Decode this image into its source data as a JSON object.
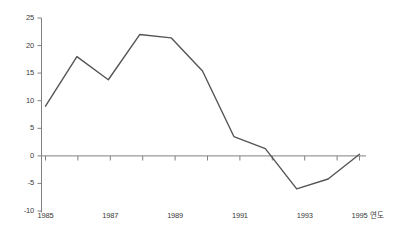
{
  "chart_data": {
    "type": "line",
    "title": "",
    "subtitle": "",
    "xlabel": "연도",
    "ylabel": "",
    "x": [
      1985,
      1986,
      1987,
      1988,
      1989,
      1990,
      1991,
      1992,
      1993,
      1994,
      1995
    ],
    "categories": [
      "1985",
      "1986",
      "1987",
      "1988",
      "1989",
      "1990",
      "1991",
      "1992",
      "1993",
      "1994",
      "1995"
    ],
    "values": [
      9.0,
      18.0,
      13.8,
      22.0,
      21.4,
      15.4,
      3.5,
      1.3,
      -6.0,
      -4.2,
      0.3
    ],
    "series": [
      {
        "name": "",
        "values": [
          9.0,
          18.0,
          13.8,
          22.0,
          21.4,
          15.4,
          3.5,
          1.3,
          -6.0,
          -4.2,
          0.3
        ]
      }
    ],
    "ylim": [
      -10,
      25
    ],
    "xlim": [
      1985,
      1995
    ],
    "yticks": [
      25,
      20,
      15,
      10,
      5,
      0,
      -5,
      -10
    ],
    "ytick_labels": [
      "25",
      "20",
      "15",
      "10",
      "5",
      "0",
      "-5",
      "-10"
    ],
    "xticks": [
      1985,
      1986,
      1987,
      1988,
      1989,
      1990,
      1991,
      1992,
      1993,
      1994,
      1995
    ],
    "xtick_labels": [
      "1985",
      "",
      "1987",
      "",
      "1989",
      "",
      "1991",
      "",
      "1993",
      "",
      "1995"
    ],
    "xtick_labels_shown": [
      "1985",
      "1987",
      "1989",
      "1991",
      "1993",
      "1995"
    ],
    "grid": false,
    "legend": false,
    "legend_position": "none",
    "zero_line": true,
    "line_color": "#555555",
    "axis_color": "#808080",
    "text_color": "#3a3a3a",
    "background": "#ffffff",
    "annotations": []
  }
}
